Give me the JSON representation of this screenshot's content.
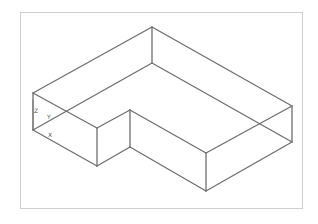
{
  "drawing": {
    "title": "L-shaped extruded solid, isometric wireframe",
    "colors": {
      "edge": "#6e6e6e",
      "border": "#cfcfcf",
      "background": "#ffffff"
    },
    "vertices": {
      "top": [
        [
          33,
          93
        ],
        [
          152,
          27
        ],
        [
          292,
          106
        ],
        [
          206,
          153
        ],
        [
          130,
          110
        ],
        [
          97,
          128
        ]
      ],
      "bottom": [
        [
          33,
          130
        ],
        [
          152,
          63
        ],
        [
          292,
          142
        ],
        [
          206,
          191
        ],
        [
          130,
          147
        ],
        [
          97,
          166
        ]
      ]
    }
  },
  "ucs_icon": {
    "x_label": "X",
    "y_label": "Y",
    "z_label": "Z"
  }
}
